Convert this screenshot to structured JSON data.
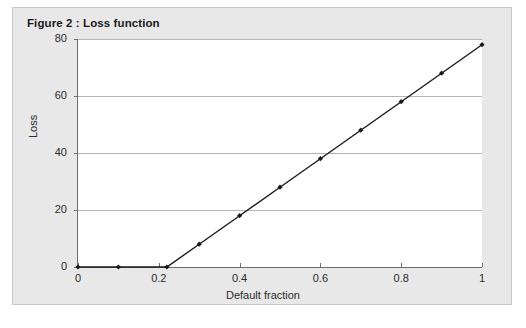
{
  "figure": {
    "title": "Figure 2 : Loss function",
    "panel_bg": "#e8e8e8",
    "plot_bg": "#ffffff",
    "border_color": "#c8c8c8",
    "axis_color": "#6e6e6e",
    "grid_color": "#b5b5b5",
    "series_color": "#1a1a1a"
  },
  "chart_data": {
    "type": "line",
    "title": "Figure 2 : Loss function",
    "xlabel": "Default fraction",
    "ylabel": "Loss",
    "xlim": [
      0,
      1
    ],
    "ylim": [
      0,
      80
    ],
    "grid": "horizontal",
    "legend": "none",
    "markers": "filled-diamond",
    "x_ticks": [
      0,
      0.2,
      0.4,
      0.6,
      0.8,
      1
    ],
    "x_tick_labels": [
      "0",
      "0.2",
      "0.4",
      "0.6",
      "0.8",
      "1"
    ],
    "y_ticks": [
      0,
      20,
      40,
      60,
      80
    ],
    "y_tick_labels": [
      "0",
      "20",
      "40",
      "60",
      "80"
    ],
    "series": [
      {
        "name": "Loss",
        "x": [
          0,
          0.1,
          0.22,
          0.3,
          0.4,
          0.5,
          0.6,
          0.7,
          0.8,
          0.9,
          1
        ],
        "values": [
          0,
          0,
          0,
          8,
          18,
          28,
          38,
          48,
          58,
          68,
          78
        ]
      }
    ]
  }
}
